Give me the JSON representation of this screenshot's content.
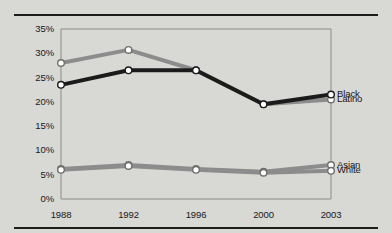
{
  "chart_data": {
    "type": "line",
    "title": "",
    "xlabel": "",
    "ylabel": "",
    "x": [
      "1988",
      "1992",
      "1996",
      "2000",
      "2003"
    ],
    "categories": [
      "1988",
      "1992",
      "1996",
      "2000",
      "2003"
    ],
    "ylim": [
      0,
      35
    ],
    "yticks": [
      "0%",
      "5%",
      "10%",
      "15%",
      "20%",
      "25%",
      "30%",
      "35%"
    ],
    "ytick_values": [
      0,
      5,
      10,
      15,
      20,
      25,
      30,
      35
    ],
    "grid": false,
    "legend_position": "right-inline",
    "series": [
      {
        "name": "Black",
        "values": [
          23.5,
          26.5,
          26.5,
          19.5,
          21.5
        ],
        "color": "#1b1b1b",
        "label": "Black"
      },
      {
        "name": "Latino",
        "values": [
          28.0,
          30.7,
          26.5,
          19.5,
          20.5
        ],
        "color": "#8c8c8c",
        "label": "Latino"
      },
      {
        "name": "Asian",
        "values": [
          6.2,
          7.0,
          6.2,
          5.6,
          7.0
        ],
        "color": "#8c8c8c",
        "label": "Asian"
      },
      {
        "name": "White",
        "values": [
          6.0,
          6.8,
          6.0,
          5.4,
          5.8
        ],
        "color": "#8c8c8c",
        "label": "White"
      }
    ]
  },
  "axis": {
    "y_labels": [
      "35%",
      "30%",
      "25%",
      "20%",
      "15%",
      "10%",
      "5%",
      "0%"
    ],
    "x_labels": [
      "1988",
      "1992",
      "1996",
      "2000",
      "2003"
    ]
  },
  "legend": {
    "black": "Black",
    "latino": "Latino",
    "asian": "Asian",
    "white": "White"
  },
  "colors": {
    "background": "#d8d8d4",
    "dark_line": "#1b1b1b",
    "gray_line": "#8c8c8c",
    "rule": "#1c1c1c",
    "plot_border": "#8a8a87",
    "text": "#17171a",
    "marker_fill": "#ffffff"
  }
}
